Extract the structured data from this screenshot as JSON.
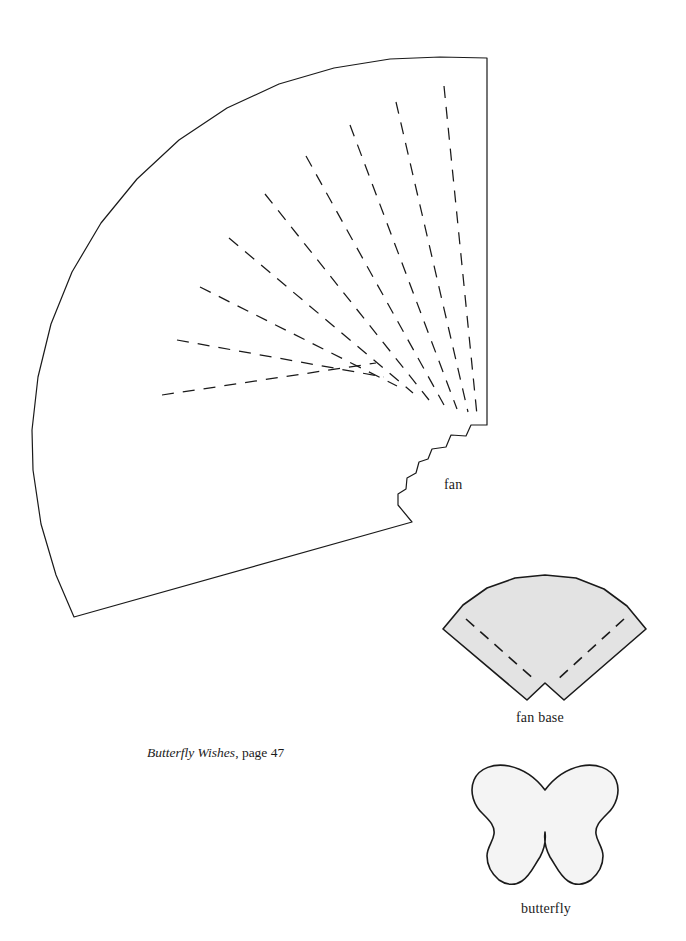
{
  "page": {
    "background_color": "#ffffff",
    "width": 686,
    "height": 941,
    "kind": "craft-pattern-template-sheet"
  },
  "caption": {
    "title": "Butterfly Wishes",
    "rest": ", page 47",
    "full_text": "Butterfly Wishes, page 47"
  },
  "labels": {
    "fan": "fan",
    "fan_base": "fan base",
    "butterfly": "butterfly"
  },
  "colors": {
    "outline": "#1a1a1a",
    "fan_fill": "#ffffff",
    "fan_base_fill": "#e3e3e3",
    "butterfly_fill": "#f4f4f4",
    "dash_stroke": "#1a1a1a",
    "text": "#1b1b1b"
  },
  "shapes": [
    {
      "id": "fan",
      "name": "fan",
      "label": "fan",
      "fill": "#ffffff",
      "stroke": "#1a1a1a",
      "stroke_width": 1.2,
      "fold_lines": 9,
      "fold_line_style": "dashed",
      "outline_path": "M 487 58 L 487 425 L 471 425 L 466 436 L 451 435 L 446 447 L 432 449 L 428 459 L 419 462 L 416 473 L 407 478 L 406 489 L 398 494 L 398 505 L 412 522 L 74 617 L 56 575 L 41 524 L 33 470 L 32 430 L 38 377 L 51 324 L 72 272 L 101 223 L 137 179 L 179 140 L 227 108 L 279 84 L 334 68 L 390 59 L 440 57 Z",
      "fold_paths": [
        "M 444 86 L 477 415",
        "M 396 102 L 468 412",
        "M 350 125 L 457 409",
        "M 306 156 L 444 405",
        "M 265 194 L 429 400",
        "M 229 238 L 413 393",
        "M 200 287 L 397 386",
        "M 177 340 L 384 377",
        "M 162 395 L 376 363"
      ]
    },
    {
      "id": "fan-base",
      "name": "fan base",
      "label": "fan base",
      "fill": "#e3e3e3",
      "stroke": "#1a1a1a",
      "stroke_width": 1.6,
      "fold_lines": 2,
      "fold_line_style": "dashed",
      "outline_path": "M 443 629 L 463 605 L 487 588 L 515 578 L 545 575 L 576 578 L 604 589 L 627 606 L 646 629 L 564 700 L 545 683 L 527 700 Z",
      "fold_paths": [
        "M 466 619 L 536 681",
        "M 624 619 L 556 681"
      ]
    },
    {
      "id": "butterfly",
      "name": "butterfly",
      "label": "butterfly",
      "fill": "#f4f4f4",
      "stroke": "#1a1a1a",
      "stroke_width": 1.6,
      "outline_path": "M 545 790 C 536 778 523 769 509 766 C 494 763 479 768 474 780 C 469 792 474 806 483 814 C 490 821 495 826 494 834 C 493 842 487 847 487 856 C 487 866 492 874 499 880 C 506 885 515 886 522 881 C 530 876 534 866 540 857 C 545 848 546 840 545 832 L 545 832 C 544 840 545 848 550 857 C 556 866 560 876 568 881 C 575 886 584 885 591 880 C 598 874 603 866 603 856 C 603 847 597 842 596 834 C 595 826 600 821 607 814 C 616 806 621 792 616 780 C 611 768 596 763 581 766 C 567 769 554 778 545 790 Z"
    }
  ]
}
